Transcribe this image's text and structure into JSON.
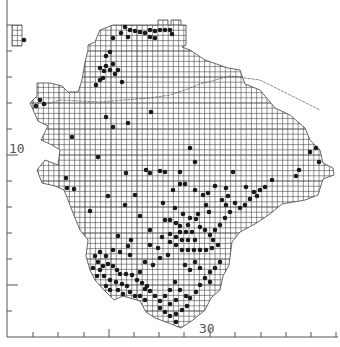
{
  "map": {
    "type": "species-distribution-grid-map",
    "grid": {
      "cell_px": 5.2,
      "origin_x": 7,
      "origin_y": 25,
      "major_px": 26
    },
    "colors": {
      "grid": "#3a3a3a",
      "outline": "#444444",
      "dot": "#1a1a1a",
      "axis": "#555555",
      "background": "#ffffff"
    },
    "axis": {
      "x_ticks": [
        33,
        58,
        84,
        109,
        134,
        159,
        184,
        210,
        235,
        261,
        286,
        311,
        336
      ],
      "x_major": [
        109,
        210
      ],
      "y_ticks": [
        25,
        51,
        77,
        103,
        129,
        155,
        181,
        207,
        233,
        259,
        285,
        311
      ],
      "y_major": [
        155,
        285
      ],
      "x_label": "30",
      "y_label": "10"
    },
    "outline": [
      [
        113,
        25
      ],
      [
        158,
        25
      ],
      [
        158,
        20
      ],
      [
        168,
        20
      ],
      [
        168,
        25
      ],
      [
        171,
        25
      ],
      [
        171,
        20
      ],
      [
        181,
        20
      ],
      [
        181,
        25
      ],
      [
        186,
        25
      ],
      [
        186,
        45
      ],
      [
        182,
        47
      ],
      [
        190,
        50
      ],
      [
        205,
        60
      ],
      [
        228,
        68
      ],
      [
        240,
        70
      ],
      [
        245,
        84
      ],
      [
        260,
        90
      ],
      [
        275,
        108
      ],
      [
        290,
        115
      ],
      [
        305,
        128
      ],
      [
        310,
        140
      ],
      [
        320,
        150
      ],
      [
        323,
        163
      ],
      [
        333,
        168
      ],
      [
        334,
        175
      ],
      [
        323,
        179
      ],
      [
        318,
        195
      ],
      [
        305,
        200
      ],
      [
        282,
        204
      ],
      [
        270,
        214
      ],
      [
        255,
        224
      ],
      [
        240,
        232
      ],
      [
        232,
        242
      ],
      [
        229,
        265
      ],
      [
        223,
        276
      ],
      [
        220,
        290
      ],
      [
        211,
        298
      ],
      [
        205,
        310
      ],
      [
        193,
        320
      ],
      [
        181,
        328
      ],
      [
        166,
        322
      ],
      [
        155,
        318
      ],
      [
        146,
        312
      ],
      [
        140,
        301
      ],
      [
        123,
        296
      ],
      [
        114,
        300
      ],
      [
        104,
        290
      ],
      [
        95,
        280
      ],
      [
        90,
        270
      ],
      [
        86,
        256
      ],
      [
        88,
        240
      ],
      [
        80,
        230
      ],
      [
        75,
        218
      ],
      [
        68,
        200
      ],
      [
        64,
        190
      ],
      [
        55,
        186
      ],
      [
        42,
        183
      ],
      [
        37,
        170
      ],
      [
        45,
        160
      ],
      [
        58,
        165
      ],
      [
        60,
        150
      ],
      [
        52,
        145
      ],
      [
        41,
        140
      ],
      [
        48,
        126
      ],
      [
        38,
        121
      ],
      [
        30,
        103
      ],
      [
        37,
        96
      ],
      [
        37,
        83
      ],
      [
        50,
        83
      ],
      [
        62,
        86
      ],
      [
        68,
        92
      ],
      [
        78,
        92
      ],
      [
        82,
        80
      ],
      [
        85,
        62
      ],
      [
        88,
        50
      ],
      [
        88,
        45
      ],
      [
        95,
        42
      ],
      [
        100,
        30
      ],
      [
        113,
        25
      ]
    ],
    "island": [
      [
        12,
        25
      ],
      [
        22,
        25
      ],
      [
        22,
        46
      ],
      [
        12,
        46
      ]
    ],
    "boundary_line": [
      [
        44,
        105
      ],
      [
        60,
        100
      ],
      [
        100,
        102
      ],
      [
        125,
        100
      ],
      [
        150,
        98
      ],
      [
        170,
        95
      ],
      [
        185,
        90
      ],
      [
        200,
        84
      ],
      [
        230,
        76
      ],
      [
        260,
        80
      ],
      [
        290,
        95
      ],
      [
        320,
        110
      ]
    ],
    "dots": [
      [
        125,
        27
      ],
      [
        130,
        30
      ],
      [
        135,
        31
      ],
      [
        140,
        32
      ],
      [
        145,
        33
      ],
      [
        150,
        30
      ],
      [
        155,
        31
      ],
      [
        160,
        30
      ],
      [
        165,
        30
      ],
      [
        170,
        30
      ],
      [
        172,
        34
      ],
      [
        150,
        37
      ],
      [
        155,
        38
      ],
      [
        128,
        37
      ],
      [
        121,
        33
      ],
      [
        113,
        38
      ],
      [
        110,
        52
      ],
      [
        106,
        56
      ],
      [
        113,
        64
      ],
      [
        106,
        66
      ],
      [
        100,
        68
      ],
      [
        104,
        71
      ],
      [
        110,
        70
      ],
      [
        118,
        70
      ],
      [
        115,
        74
      ],
      [
        100,
        80
      ],
      [
        96,
        85
      ],
      [
        122,
        82
      ],
      [
        103,
        78
      ],
      [
        24,
        40
      ],
      [
        36,
        106
      ],
      [
        40,
        100
      ],
      [
        106,
        117
      ],
      [
        151,
        112
      ],
      [
        128,
        123
      ],
      [
        113,
        127
      ],
      [
        98,
        157
      ],
      [
        146,
        170
      ],
      [
        126,
        173
      ],
      [
        150,
        173
      ],
      [
        160,
        171
      ],
      [
        165,
        172
      ],
      [
        180,
        172
      ],
      [
        173,
        190
      ],
      [
        163,
        203
      ],
      [
        190,
        148
      ],
      [
        195,
        162
      ],
      [
        215,
        186
      ],
      [
        226,
        188
      ],
      [
        233,
        172
      ],
      [
        246,
        187
      ],
      [
        254,
        192
      ],
      [
        260,
        190
      ],
      [
        265,
        187
      ],
      [
        272,
        180
      ],
      [
        296,
        176
      ],
      [
        310,
        152
      ],
      [
        316,
        148
      ],
      [
        319,
        162
      ],
      [
        299,
        170
      ],
      [
        90,
        211
      ],
      [
        66,
        178
      ],
      [
        74,
        189
      ],
      [
        44,
        104
      ],
      [
        72,
        137
      ],
      [
        67,
        188
      ],
      [
        180,
        184
      ],
      [
        185,
        184
      ],
      [
        195,
        190
      ],
      [
        203,
        195
      ],
      [
        208,
        193
      ],
      [
        206,
        205
      ],
      [
        209,
        212
      ],
      [
        196,
        219
      ],
      [
        190,
        218
      ],
      [
        198,
        214
      ],
      [
        175,
        208
      ],
      [
        183,
        214
      ],
      [
        188,
        225
      ],
      [
        176,
        223
      ],
      [
        170,
        220
      ],
      [
        165,
        220
      ],
      [
        180,
        226
      ],
      [
        180,
        232
      ],
      [
        186,
        232
      ],
      [
        192,
        232
      ],
      [
        170,
        234
      ],
      [
        176,
        237
      ],
      [
        182,
        240
      ],
      [
        188,
        240
      ],
      [
        170,
        242
      ],
      [
        176,
        245
      ],
      [
        182,
        250
      ],
      [
        188,
        250
      ],
      [
        194,
        250
      ],
      [
        200,
        250
      ],
      [
        206,
        250
      ],
      [
        212,
        248
      ],
      [
        218,
        245
      ],
      [
        213,
        240
      ],
      [
        210,
        235
      ],
      [
        205,
        230
      ],
      [
        200,
        227
      ],
      [
        195,
        240
      ],
      [
        215,
        230
      ],
      [
        220,
        225
      ],
      [
        225,
        218
      ],
      [
        230,
        212
      ],
      [
        226,
        205
      ],
      [
        222,
        200
      ],
      [
        228,
        196
      ],
      [
        235,
        203
      ],
      [
        240,
        208
      ],
      [
        245,
        205
      ],
      [
        250,
        199
      ],
      [
        257,
        196
      ],
      [
        220,
        262
      ],
      [
        215,
        268
      ],
      [
        210,
        272
      ],
      [
        200,
        268
      ],
      [
        195,
        262
      ],
      [
        190,
        270
      ],
      [
        185,
        265
      ],
      [
        205,
        278
      ],
      [
        210,
        282
      ],
      [
        200,
        285
      ],
      [
        196,
        292
      ],
      [
        186,
        296
      ],
      [
        180,
        290
      ],
      [
        175,
        282
      ],
      [
        170,
        290
      ],
      [
        165,
        296
      ],
      [
        176,
        300
      ],
      [
        170,
        304
      ],
      [
        160,
        301
      ],
      [
        155,
        296
      ],
      [
        150,
        291
      ],
      [
        145,
        289
      ],
      [
        160,
        308
      ],
      [
        165,
        312
      ],
      [
        170,
        316
      ],
      [
        176,
        314
      ],
      [
        182,
        310
      ],
      [
        187,
        306
      ],
      [
        190,
        298
      ],
      [
        176,
        322
      ],
      [
        95,
        256
      ],
      [
        100,
        252
      ],
      [
        106,
        256
      ],
      [
        98,
        262
      ],
      [
        103,
        266
      ],
      [
        108,
        264
      ],
      [
        113,
        266
      ],
      [
        117,
        270
      ],
      [
        120,
        274
      ],
      [
        126,
        274
      ],
      [
        132,
        275
      ],
      [
        137,
        280
      ],
      [
        142,
        283
      ],
      [
        147,
        286
      ],
      [
        100,
        270
      ],
      [
        104,
        276
      ],
      [
        110,
        280
      ],
      [
        116,
        282
      ],
      [
        122,
        284
      ],
      [
        127,
        286
      ],
      [
        130,
        292
      ],
      [
        135,
        296
      ],
      [
        140,
        296
      ],
      [
        145,
        300
      ],
      [
        118,
        290
      ],
      [
        123,
        294
      ],
      [
        110,
        290
      ],
      [
        106,
        286
      ],
      [
        93,
        268
      ],
      [
        97,
        276
      ],
      [
        113,
        250
      ],
      [
        120,
        252
      ],
      [
        130,
        255
      ],
      [
        145,
        262
      ],
      [
        153,
        265
      ],
      [
        140,
        272
      ],
      [
        160,
        258
      ],
      [
        168,
        255
      ],
      [
        158,
        248
      ],
      [
        150,
        245
      ],
      [
        128,
        246
      ],
      [
        118,
        236
      ],
      [
        131,
        240
      ],
      [
        150,
        230
      ],
      [
        162,
        237
      ],
      [
        140,
        216
      ],
      [
        125,
        205
      ],
      [
        108,
        196
      ],
      [
        135,
        195
      ]
    ]
  }
}
